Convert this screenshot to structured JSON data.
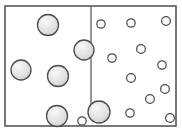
{
  "figure": {
    "name": "two-compartment-particle-diagram",
    "type": "diagram",
    "width": 182,
    "height": 133,
    "background_color": "#ffffff"
  },
  "container": {
    "label": "container-box",
    "x": 5,
    "y": 6,
    "width": 171,
    "height": 120,
    "fill_color": "#ffffff",
    "border_color": "#58585a",
    "border_width": 1.6
  },
  "divider": {
    "label": "membrane-divider",
    "x": 91,
    "y_top": 6,
    "y_bottom": 106,
    "color": "#6a6a6c",
    "width": 1.4
  },
  "styles": {
    "large_particle": {
      "fill_color": "#e2e2e2",
      "highlight_color": "#f4f4f4",
      "stroke_color": "#4b4b4d",
      "stroke_width": 1.3
    },
    "small_particle": {
      "fill_color": "#fbfbfb",
      "highlight_color": "#ffffff",
      "stroke_color": "#4b4b4d",
      "stroke_width": 1.2
    }
  },
  "particles": {
    "large_count": 7,
    "small_count": 16,
    "large": [
      {
        "id": "large-1",
        "cx": 48,
        "cy": 25,
        "r": 10.5,
        "side": "left"
      },
      {
        "id": "large-2",
        "cx": 84,
        "cy": 50,
        "r": 10.0,
        "side": "left"
      },
      {
        "id": "large-3",
        "cx": 21,
        "cy": 70,
        "r": 10.0,
        "side": "left"
      },
      {
        "id": "large-4",
        "cx": 58,
        "cy": 76,
        "r": 10.5,
        "side": "left"
      },
      {
        "id": "large-5",
        "cx": 57,
        "cy": 116,
        "r": 10.5,
        "side": "left"
      },
      {
        "id": "large-6",
        "cx": 99,
        "cy": 112,
        "r": 11.0,
        "side": "divider"
      },
      {
        "id": "large-7",
        "cx": 84,
        "cy": 50,
        "r": 0.0,
        "side": "hidden"
      }
    ],
    "small": [
      {
        "id": "small-1",
        "cx": 101,
        "cy": 24,
        "r": 4.2,
        "side": "right"
      },
      {
        "id": "small-2",
        "cx": 131,
        "cy": 23,
        "r": 4.2,
        "side": "right"
      },
      {
        "id": "small-3",
        "cx": 166,
        "cy": 21,
        "r": 4.4,
        "side": "right"
      },
      {
        "id": "small-4",
        "cx": 141,
        "cy": 49,
        "r": 4.4,
        "side": "right"
      },
      {
        "id": "small-5",
        "cx": 112,
        "cy": 58,
        "r": 4.2,
        "side": "right"
      },
      {
        "id": "small-6",
        "cx": 162,
        "cy": 65,
        "r": 4.2,
        "side": "right"
      },
      {
        "id": "small-7",
        "cx": 131,
        "cy": 78,
        "r": 4.4,
        "side": "right"
      },
      {
        "id": "small-8",
        "cx": 165,
        "cy": 89,
        "r": 4.4,
        "side": "right"
      },
      {
        "id": "small-9",
        "cx": 150,
        "cy": 99,
        "r": 4.4,
        "side": "right"
      },
      {
        "id": "small-10",
        "cx": 130,
        "cy": 113,
        "r": 4.2,
        "side": "right"
      },
      {
        "id": "small-11",
        "cx": 170,
        "cy": 118,
        "r": 4.4,
        "side": "right"
      },
      {
        "id": "small-12",
        "cx": 82,
        "cy": 121,
        "r": 4.2,
        "side": "left"
      },
      {
        "id": "small-13",
        "cx": 152,
        "cy": 109,
        "r": 0.0,
        "side": "hidden"
      },
      {
        "id": "small-14",
        "cx": 118,
        "cy": 97,
        "r": 0.0,
        "side": "hidden"
      },
      {
        "id": "small-15",
        "cx": 145,
        "cy": 35,
        "r": 0.0,
        "side": "hidden"
      },
      {
        "id": "small-16",
        "cx": 104,
        "cy": 88,
        "r": 0.0,
        "side": "hidden"
      }
    ]
  }
}
